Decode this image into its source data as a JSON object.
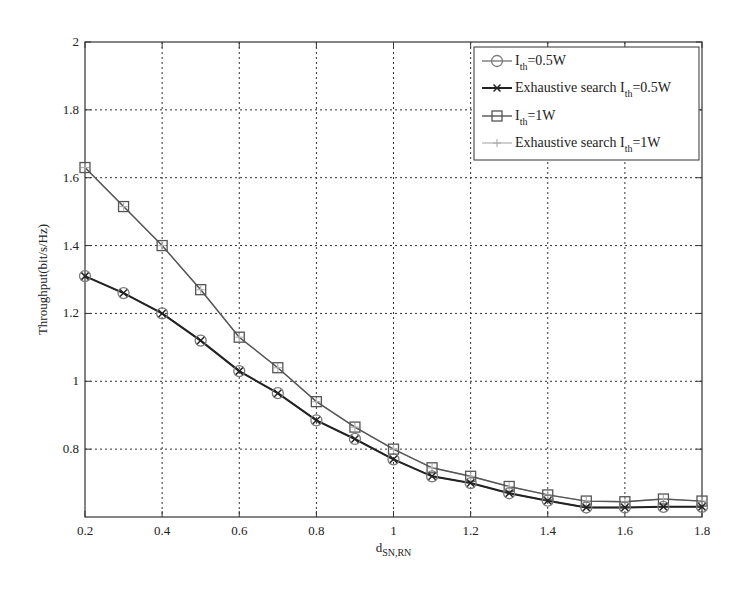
{
  "chart_data": {
    "type": "line",
    "title": "",
    "xlabel": "d",
    "xlabel_subscript": "SN,RN",
    "ylabel": "Throughput(bit/s/Hz)",
    "xlim": [
      0.2,
      1.8
    ],
    "ylim": [
      0.6,
      2.0
    ],
    "grid": true,
    "legend_position": "top-right",
    "x_ticks": [
      0.2,
      0.4,
      0.6,
      0.8,
      1.0,
      1.2,
      1.4,
      1.6,
      1.8
    ],
    "x_tick_labels": [
      "0.2",
      "0.4",
      "0.6",
      "0.8",
      "1",
      "1.2",
      "1.4",
      "1.6",
      "1.8"
    ],
    "y_ticks": [
      0.8,
      1.0,
      1.2,
      1.4,
      1.6,
      1.8,
      2.0
    ],
    "y_tick_labels": [
      "0.8",
      "1",
      "1.2",
      "1.4",
      "1.6",
      "1.8",
      "2"
    ],
    "x": [
      0.2,
      0.3,
      0.4,
      0.5,
      0.6,
      0.7,
      0.8,
      0.9,
      1.0,
      1.1,
      1.2,
      1.3,
      1.4,
      1.5,
      1.6,
      1.7,
      1.8
    ],
    "series": [
      {
        "name": "I_th=0.5W",
        "legend_main": "I",
        "legend_sub": "th",
        "legend_tail": "=0.5W",
        "marker": "circle",
        "color": "#7a7a7a",
        "values": [
          1.31,
          1.26,
          1.2,
          1.12,
          1.03,
          0.965,
          0.885,
          0.83,
          0.77,
          0.72,
          0.7,
          0.67,
          0.648,
          0.628,
          0.628,
          0.63,
          0.63
        ]
      },
      {
        "name": "Exhaustive search I_th=0.5W",
        "legend_main": "Exhaustive search I",
        "legend_sub": "th",
        "legend_tail": "=0.5W",
        "marker": "x",
        "color": "#222222",
        "values": [
          1.31,
          1.26,
          1.2,
          1.12,
          1.03,
          0.965,
          0.885,
          0.83,
          0.77,
          0.72,
          0.7,
          0.67,
          0.648,
          0.628,
          0.628,
          0.63,
          0.63
        ]
      },
      {
        "name": "I_th=1W",
        "legend_main": "I",
        "legend_sub": "th",
        "legend_tail": "=1W",
        "marker": "square",
        "color": "#555555",
        "values": [
          1.63,
          1.515,
          1.4,
          1.27,
          1.13,
          1.04,
          0.94,
          0.865,
          0.8,
          0.745,
          0.72,
          0.69,
          0.665,
          0.647,
          0.645,
          0.653,
          0.647
        ]
      },
      {
        "name": "Exhaustive search I_th=1W",
        "legend_main": "Exhaustive search I",
        "legend_sub": "th",
        "legend_tail": "=1W",
        "marker": "plus",
        "color": "#b0b0b0",
        "values": [
          1.63,
          1.515,
          1.4,
          1.27,
          1.13,
          1.04,
          0.94,
          0.865,
          0.8,
          0.745,
          0.72,
          0.69,
          0.665,
          0.647,
          0.645,
          0.653,
          0.647
        ]
      }
    ]
  }
}
